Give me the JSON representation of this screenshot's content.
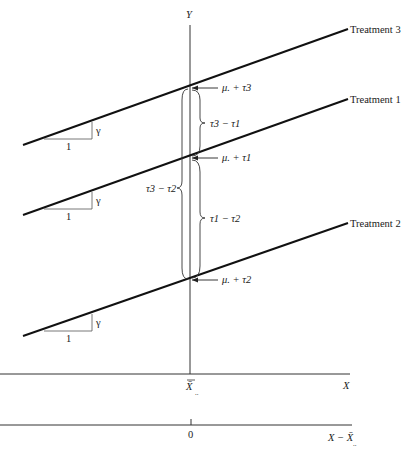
{
  "diagram": {
    "type": "analysis-of-covariance-parallel-lines",
    "axes": {
      "y_label": "Y",
      "x_label": "X",
      "x_center_label": "X̄",
      "x_center_sub": "..",
      "centered_axis_label": "X − X̄",
      "centered_axis_sub": "..",
      "centered_origin_label": "0"
    },
    "treatments": [
      {
        "name": "Treatment 3",
        "intercept_label": "μ. + τ3",
        "slope_run": "1",
        "slope_rise": "γ"
      },
      {
        "name": "Treatment 1",
        "intercept_label": "μ. + τ1",
        "slope_run": "1",
        "slope_rise": "γ"
      },
      {
        "name": "Treatment 2",
        "intercept_label": "μ. + τ2",
        "slope_run": "1",
        "slope_rise": "γ"
      }
    ],
    "braces": [
      {
        "label": "τ3 − τ1",
        "from": "Treatment 3",
        "to": "Treatment 1"
      },
      {
        "label": "τ1 − τ2",
        "from": "Treatment 1",
        "to": "Treatment 2"
      },
      {
        "label": "τ3 − τ2",
        "from": "Treatment 3",
        "to": "Treatment 2"
      }
    ]
  }
}
